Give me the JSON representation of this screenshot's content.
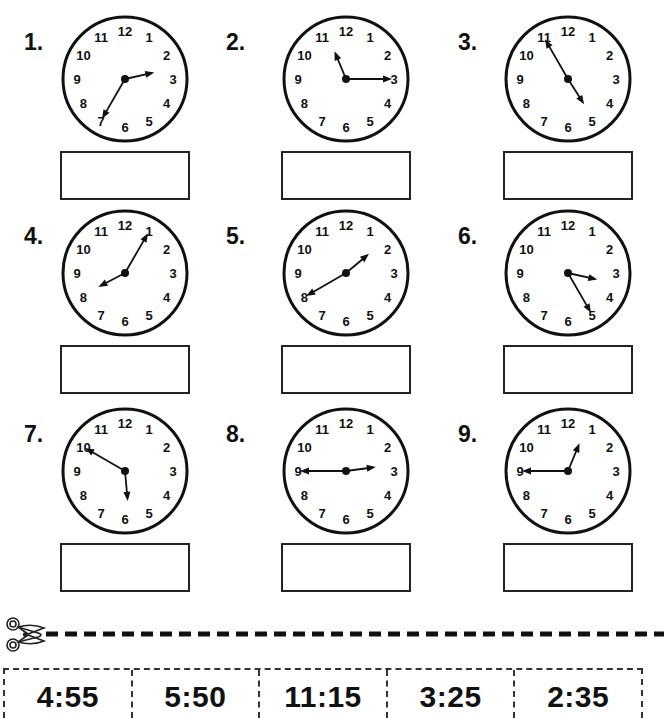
{
  "worksheet": {
    "problems": [
      {
        "number": "1.",
        "hour_pos": 2.58,
        "minute_pos": 7,
        "answer": ""
      },
      {
        "number": "2.",
        "hour_pos": 11.25,
        "minute_pos": 3,
        "answer": ""
      },
      {
        "number": "3.",
        "hour_pos": 4.92,
        "minute_pos": 11,
        "answer": ""
      },
      {
        "number": "4.",
        "hour_pos": 8.08,
        "minute_pos": 1,
        "answer": ""
      },
      {
        "number": "5.",
        "hour_pos": 1.67,
        "minute_pos": 8,
        "answer": ""
      },
      {
        "number": "6.",
        "hour_pos": 3.42,
        "minute_pos": 5,
        "answer": ""
      },
      {
        "number": "7.",
        "hour_pos": 5.83,
        "minute_pos": 10,
        "answer": ""
      },
      {
        "number": "8.",
        "hour_pos": 2.75,
        "minute_pos": 9,
        "answer": ""
      },
      {
        "number": "9.",
        "hour_pos": 12.75,
        "minute_pos": 9,
        "answer": ""
      }
    ],
    "clock_numerals": [
      "12",
      "1",
      "2",
      "3",
      "4",
      "5",
      "6",
      "7",
      "8",
      "9",
      "10",
      "11"
    ],
    "cut_strip": {
      "icon": "scissors-icon",
      "answers": [
        "4:55",
        "5:50",
        "11:15",
        "3:25",
        "2:35"
      ]
    }
  }
}
